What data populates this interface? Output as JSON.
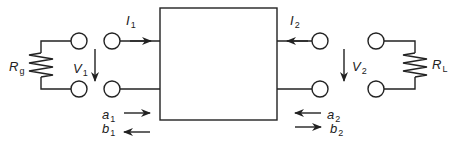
{
  "diagram": {
    "colors": {
      "stroke": "#222222",
      "background": "#ffffff"
    },
    "labels": {
      "I1": {
        "main": "I",
        "sub": "1"
      },
      "I2": {
        "main": "I",
        "sub": "2"
      },
      "V1": {
        "main": "V",
        "sub": "1"
      },
      "V2": {
        "main": "V",
        "sub": "2"
      },
      "Rg": {
        "main": "R",
        "sub": "g"
      },
      "RL": {
        "main": "R",
        "sub": "L"
      },
      "a1": {
        "main": "a",
        "sub": "1"
      },
      "b1": {
        "main": "b",
        "sub": "1"
      },
      "a2": {
        "main": "a",
        "sub": "2"
      },
      "b2": {
        "main": "b",
        "sub": "2"
      }
    },
    "components": [
      "source-resistor",
      "port-1-terminals",
      "two-port-network-box",
      "port-2-terminals",
      "load-resistor"
    ]
  }
}
